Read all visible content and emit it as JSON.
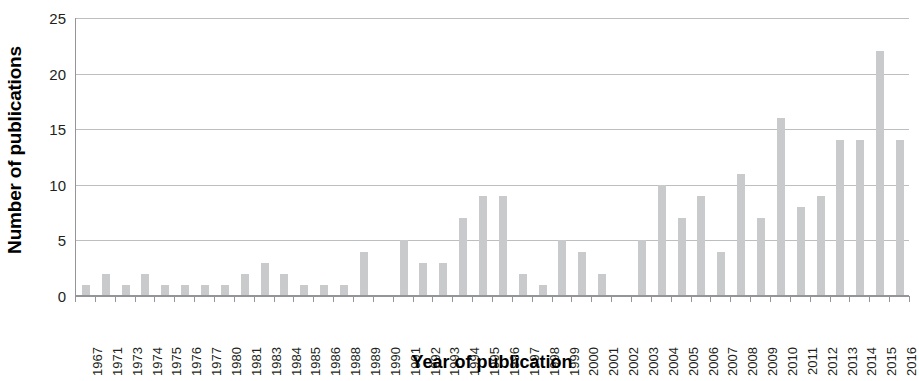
{
  "chart_data": {
    "type": "bar",
    "title": "",
    "xlabel": "Year of publication",
    "ylabel": "Number of publications",
    "ylim": [
      0,
      25
    ],
    "yticks": [
      0,
      5,
      10,
      15,
      20,
      25
    ],
    "grid": true,
    "legend": false,
    "bar_color": "#c9cacb",
    "axis_color": "#939598",
    "gridline_color": "#bcbec0",
    "categories": [
      "1967",
      "1971",
      "1973",
      "1974",
      "1975",
      "1976",
      "1977",
      "1980",
      "1981",
      "1983",
      "1984",
      "1985",
      "1986",
      "1988",
      "1989",
      "1990",
      "1991",
      "1992",
      "1993",
      "1994",
      "1995",
      "1996",
      "1997",
      "1998",
      "1999",
      "2000",
      "2001",
      "2002",
      "2003",
      "2004",
      "2005",
      "2006",
      "2007",
      "2008",
      "2009",
      "2010",
      "2011",
      "2012",
      "2013",
      "2014",
      "2015",
      "2016"
    ],
    "values": [
      1,
      2,
      1,
      2,
      1,
      1,
      1,
      1,
      2,
      3,
      2,
      1,
      1,
      1,
      4,
      0,
      5,
      3,
      3,
      7,
      9,
      9,
      2,
      1,
      5,
      4,
      2,
      0,
      5,
      10,
      7,
      9,
      4,
      11,
      7,
      16,
      8,
      9,
      14,
      14,
      22,
      14
    ]
  }
}
